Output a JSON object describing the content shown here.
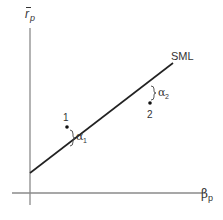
{
  "diagram": {
    "y_axis": {
      "label": "r",
      "label_accent": "̄",
      "label_sub": "p"
    },
    "x_axis": {
      "label": "β",
      "label_sub": "p"
    },
    "line": {
      "label": "SML"
    },
    "points": [
      {
        "id": "1",
        "label": "1",
        "alpha_label": "α",
        "alpha_sub": "1",
        "position": "above-line"
      },
      {
        "id": "2",
        "label": "2",
        "alpha_label": "α",
        "alpha_sub": "2",
        "position": "below-line"
      }
    ],
    "colors": {
      "axis": "#888888",
      "line": "#222222",
      "text": "#333333"
    }
  }
}
